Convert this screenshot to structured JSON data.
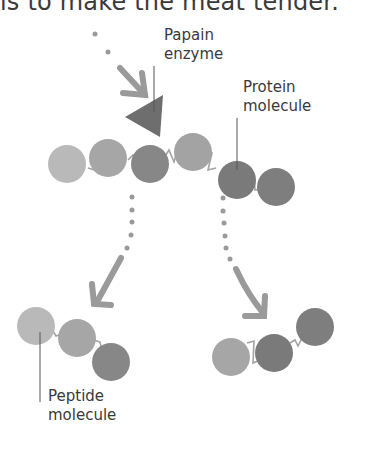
{
  "caption": "is to make the meat tender.",
  "labels": {
    "enzyme": [
      "Papain",
      "enzyme"
    ],
    "protein": [
      "Protein",
      "molecule"
    ],
    "peptide": [
      "Peptide",
      "molecule"
    ]
  },
  "colors": {
    "light": "#b9b9b9",
    "medium": "#a3a3a3",
    "dark": "#7e7e7e",
    "darker": "#747474",
    "arrow": "#9a9a9a",
    "enzyme": "#6e6e6e",
    "line": "#555555",
    "text": "#3a3a3a"
  }
}
